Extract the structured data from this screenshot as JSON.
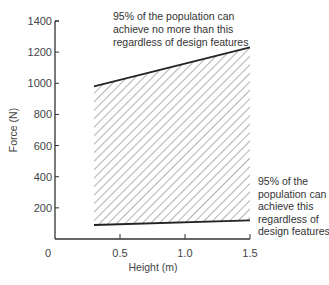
{
  "chart_data": {
    "type": "area",
    "title": "",
    "xlabel": "Height  (m)",
    "ylabel": "Force  (N)",
    "xlim": [
      0,
      1.5
    ],
    "ylim": [
      0,
      1400
    ],
    "x_ticks": [
      "0",
      "0.5",
      "1.0",
      "1.5"
    ],
    "y_ticks": [
      "200",
      "400",
      "600",
      "800",
      "1000",
      "1200",
      "1400"
    ],
    "grid": false,
    "series": [
      {
        "name": "Upper limit (95% can achieve no more than this)",
        "x": [
          0.3,
          1.5
        ],
        "values": [
          980,
          1230
        ]
      },
      {
        "name": "Lower limit (95% can achieve this)",
        "x": [
          0.3,
          1.5
        ],
        "values": [
          90,
          120
        ]
      }
    ],
    "fill": "hatched region between upper and lower limits",
    "annotations": {
      "upper": [
        "95% of the population can",
        "achieve no more than this",
        "regardless of design features"
      ],
      "lower": [
        "95% of the",
        "population can",
        "achieve this",
        "regardless of",
        "design features"
      ]
    }
  }
}
